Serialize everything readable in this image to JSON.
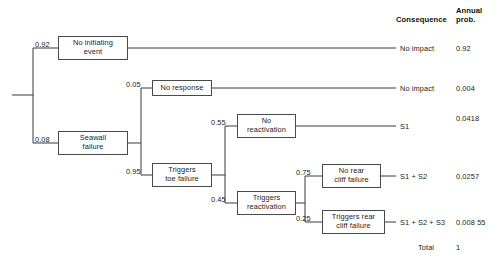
{
  "diagram": {
    "type": "event-tree",
    "columns": {
      "consequence_header": "Consequence",
      "annual_prob_header_line1": "Annual",
      "annual_prob_header_line2": "prob."
    },
    "nodes": [
      {
        "id": "no-initiating-event",
        "label_line1": "No initiating",
        "label_line2": "event",
        "branch_prob": "0.92"
      },
      {
        "id": "seawall-failure",
        "label_line1": "Seawall",
        "label_line2": "failure",
        "branch_prob": "0.08"
      },
      {
        "id": "no-response",
        "label_line1": "No response",
        "label_line2": "",
        "branch_prob": "0.05"
      },
      {
        "id": "triggers-toe-failure",
        "label_line1": "Triggers",
        "label_line2": "toe failure",
        "branch_prob": "0.95"
      },
      {
        "id": "no-reactivation",
        "label_line1": "No",
        "label_line2": "reactivation",
        "branch_prob": "0.55"
      },
      {
        "id": "triggers-reactivation",
        "label_line1": "Triggers",
        "label_line2": "reactivation",
        "branch_prob": "0.45"
      },
      {
        "id": "no-rear-cliff-failure",
        "label_line1": "No rear",
        "label_line2": "cliff failure",
        "branch_prob": "0.75"
      },
      {
        "id": "triggers-rear-cliff-failure",
        "label_line1": "Triggers rear",
        "label_line2": "cliff failure",
        "branch_prob": "0.25"
      }
    ],
    "outcomes": [
      {
        "consequence": "No impact",
        "annual_prob": "0.92"
      },
      {
        "consequence": "No impact",
        "annual_prob": "0.004"
      },
      {
        "consequence": "S1",
        "annual_prob": "0.0418"
      },
      {
        "consequence": "S1 + S2",
        "annual_prob": "0.0257"
      },
      {
        "consequence": "S1 + S2 + S3",
        "annual_prob": "0.008 55"
      }
    ],
    "total": {
      "label": "Total",
      "value": "1"
    }
  }
}
